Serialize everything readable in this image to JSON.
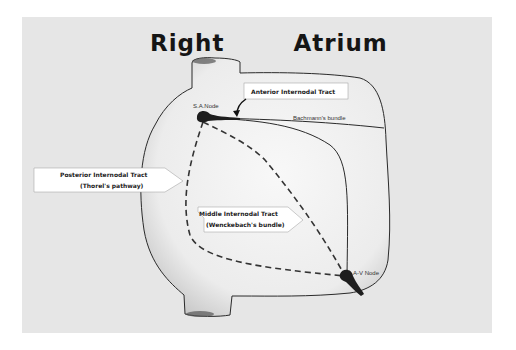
{
  "title": "Right   Atrium",
  "labels": {
    "sa_node": "S.A.Node",
    "av_node": "A-V Node",
    "bachmann": "Bachmann's bundle",
    "anterior": "Anterior Internodal Tract",
    "posterior_line1": "Posterior Internodal Tract",
    "posterior_line2": "(Thorel's pathway)",
    "middle_line1": "Middle Internodal Tract",
    "middle_line2": "(Wenckebach's bundle)"
  },
  "colors": {
    "background": "#e6e6e6",
    "chamber_fill": "#f4f4f4",
    "outline": "#2a2a2a",
    "node": "#1e1e1e",
    "label_box": "#ffffff"
  }
}
